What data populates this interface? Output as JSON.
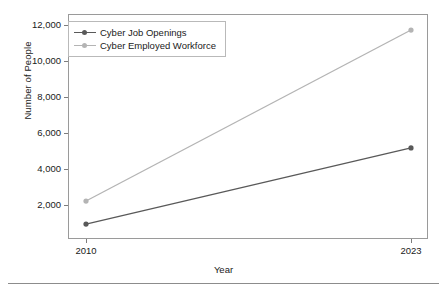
{
  "chart_data": {
    "type": "line",
    "title": "",
    "xlabel": "Year",
    "ylabel": "Number of People",
    "x": [
      2010,
      2023
    ],
    "xtick_labels": [
      "2010",
      "2023"
    ],
    "ytick_labels": [
      "2,000",
      "4,000",
      "6,000",
      "8,000",
      "10,000",
      "12,000"
    ],
    "yticks": [
      2000,
      4000,
      6000,
      8000,
      10000,
      12000
    ],
    "ylim": [
      0,
      12900
    ],
    "xlim": [
      2010,
      2023
    ],
    "grid": false,
    "legend_position": "upper left",
    "series": [
      {
        "name": "Cyber Job Openings",
        "color": "#595959",
        "marker": "circle",
        "values": [
          940,
          5170
        ]
      },
      {
        "name": "Cyber Employed Workforce",
        "color": "#b4b4b4",
        "marker": "circle",
        "values": [
          2220,
          11720
        ]
      }
    ]
  },
  "legend": {
    "items": [
      {
        "label": "Cyber Job Openings",
        "color": "#595959"
      },
      {
        "label": "Cyber Employed Workforce",
        "color": "#b4b4b4"
      }
    ]
  },
  "axes": {
    "x_label": "Year",
    "y_label": "Number of People",
    "x_ticks": [
      {
        "label": "2010",
        "value": 2010
      },
      {
        "label": "2023",
        "value": 2023
      }
    ],
    "y_ticks": [
      {
        "label": "12,000",
        "value": 12000
      },
      {
        "label": "10,000",
        "value": 10000
      },
      {
        "label": "8,000",
        "value": 8000
      },
      {
        "label": "6,000",
        "value": 6000
      },
      {
        "label": "4,000",
        "value": 4000
      },
      {
        "label": "2,000",
        "value": 2000
      }
    ]
  },
  "colors": {
    "frame": "#9a9a9a",
    "series_dark": "#595959",
    "series_light": "#b4b4b4",
    "text": "#1a1a1a",
    "rule": "#8c8c8c"
  }
}
